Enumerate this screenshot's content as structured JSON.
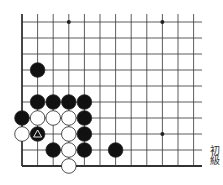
{
  "board": {
    "origin_x": 22,
    "origin_y": 22,
    "spacing_x": 15.6,
    "spacing_y": 16.0,
    "cols": 12,
    "rows": 10,
    "line_end_x": 202,
    "line_color": "#333333",
    "star_points": [
      [
        3,
        0
      ],
      [
        9,
        0
      ],
      [
        9,
        7
      ]
    ],
    "stones": [
      {
        "c": 1,
        "r": 3,
        "color": "black"
      },
      {
        "c": 1,
        "r": 5,
        "color": "black"
      },
      {
        "c": 2,
        "r": 5,
        "color": "black"
      },
      {
        "c": 3,
        "r": 5,
        "color": "black"
      },
      {
        "c": 4,
        "r": 5,
        "color": "black"
      },
      {
        "c": 0,
        "r": 6,
        "color": "black"
      },
      {
        "c": 1,
        "r": 6,
        "color": "white"
      },
      {
        "c": 2,
        "r": 6,
        "color": "white"
      },
      {
        "c": 3,
        "r": 6,
        "color": "white"
      },
      {
        "c": 4,
        "r": 6,
        "color": "black"
      },
      {
        "c": 0,
        "r": 7,
        "color": "white"
      },
      {
        "c": 1,
        "r": 7,
        "color": "black",
        "mark": "triangle"
      },
      {
        "c": 3,
        "r": 7,
        "color": "white"
      },
      {
        "c": 4,
        "r": 7,
        "color": "black"
      },
      {
        "c": 2,
        "r": 8,
        "color": "black"
      },
      {
        "c": 3,
        "r": 8,
        "color": "white"
      },
      {
        "c": 4,
        "r": 8,
        "color": "black"
      },
      {
        "c": 6,
        "r": 8,
        "color": "black"
      },
      {
        "c": 3,
        "r": 9,
        "color": "white"
      }
    ]
  },
  "caption": "初級"
}
